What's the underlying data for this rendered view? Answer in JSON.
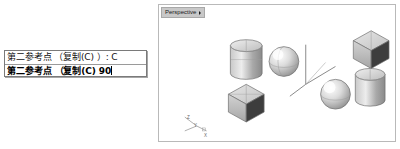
{
  "command_box": {
    "name": "command-prompt-box",
    "lines": [
      {
        "text": "第二参考点 （复制(C) ）: C",
        "state": "history"
      },
      {
        "text": "第二参考点 （复制(C) 90",
        "state": "active"
      }
    ]
  },
  "viewport": {
    "tab_label": "Perspective",
    "tab_marker": "chevron-right-icon",
    "ucs": {
      "x_label": "X",
      "y_label": "Y",
      "z_label": "Z"
    },
    "objects": [
      {
        "name": "cylinder-left",
        "shape": "cylinder"
      },
      {
        "name": "sphere-left",
        "shape": "sphere"
      },
      {
        "name": "cube-left",
        "shape": "cube"
      },
      {
        "name": "axis-gizmo-center",
        "shape": "axes"
      },
      {
        "name": "cube-right",
        "shape": "cube"
      },
      {
        "name": "cylinder-right",
        "shape": "cylinder"
      },
      {
        "name": "sphere-right",
        "shape": "sphere"
      }
    ]
  },
  "colors": {
    "background": "#ffffff",
    "panel_border": "#b9b9b9",
    "box_border": "#7a7a7a",
    "tab_fill": "#c8c8c8",
    "object_light": "#e8e8e8",
    "object_mid": "#b4b4b4",
    "object_dark": "#7d7d7d",
    "object_darkest": "#4a4a4a",
    "axis_line": "#8a8a8a"
  }
}
